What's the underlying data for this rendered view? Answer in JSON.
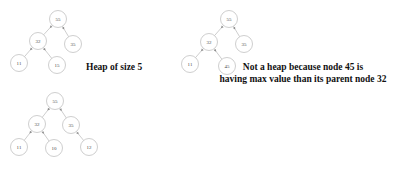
{
  "figure": {
    "background_color": "#ffffff",
    "node_fill": "#ffffff",
    "node_stroke": "#b9b9b9",
    "edge_color": "#b9b9b9",
    "text_color": "#4a4a4a",
    "caption_color": "#111111"
  },
  "trees": [
    {
      "id": "tree-heap-size-5",
      "node_count": 5,
      "nodes": [
        {
          "id": "t1-n0",
          "value": "55",
          "x": 58,
          "y": 19,
          "r": 8.5
        },
        {
          "id": "t1-n1",
          "value": "32",
          "x": 38,
          "y": 41,
          "r": 8.5
        },
        {
          "id": "t1-n2",
          "value": "35",
          "x": 73,
          "y": 44,
          "r": 8.5
        },
        {
          "id": "t1-n3",
          "value": "11",
          "x": 19,
          "y": 63,
          "r": 8.5
        },
        {
          "id": "t1-n4",
          "value": "15",
          "x": 57,
          "y": 65,
          "r": 8.5
        }
      ],
      "edges": [
        {
          "from": "t1-n0",
          "to": "t1-n1"
        },
        {
          "from": "t1-n0",
          "to": "t1-n2"
        },
        {
          "from": "t1-n1",
          "to": "t1-n3"
        },
        {
          "from": "t1-n1",
          "to": "t1-n4"
        }
      ]
    },
    {
      "id": "tree-not-a-heap",
      "node_count": 5,
      "nodes": [
        {
          "id": "t2-n0",
          "value": "55",
          "x": 229,
          "y": 19,
          "r": 8.5
        },
        {
          "id": "t2-n1",
          "value": "32",
          "x": 209,
          "y": 42,
          "r": 8.5
        },
        {
          "id": "t2-n2",
          "value": "35",
          "x": 244,
          "y": 44,
          "r": 8.5
        },
        {
          "id": "t2-n3",
          "value": "11",
          "x": 190,
          "y": 64,
          "r": 8.5
        },
        {
          "id": "t2-n4",
          "value": "45",
          "x": 227,
          "y": 66,
          "r": 8.5
        }
      ],
      "edges": [
        {
          "from": "t2-n0",
          "to": "t2-n1"
        },
        {
          "from": "t2-n0",
          "to": "t2-n2"
        },
        {
          "from": "t2-n1",
          "to": "t2-n3"
        },
        {
          "from": "t2-n1",
          "to": "t2-n4"
        }
      ]
    },
    {
      "id": "tree-heap-size-6",
      "node_count": 6,
      "nodes": [
        {
          "id": "t3-n0",
          "value": "55",
          "x": 55,
          "y": 101,
          "r": 8.5
        },
        {
          "id": "t3-n1",
          "value": "32",
          "x": 37,
          "y": 124,
          "r": 8.5
        },
        {
          "id": "t3-n2",
          "value": "35",
          "x": 71,
          "y": 125,
          "r": 8.5
        },
        {
          "id": "t3-n3",
          "value": "11",
          "x": 19,
          "y": 147,
          "r": 8.5
        },
        {
          "id": "t3-n4",
          "value": "10",
          "x": 54,
          "y": 148,
          "r": 8.5
        },
        {
          "id": "t3-n5",
          "value": "12",
          "x": 89,
          "y": 147,
          "r": 8.5
        }
      ],
      "edges": [
        {
          "from": "t3-n0",
          "to": "t3-n1"
        },
        {
          "from": "t3-n0",
          "to": "t3-n2"
        },
        {
          "from": "t3-n1",
          "to": "t3-n3"
        },
        {
          "from": "t3-n1",
          "to": "t3-n4"
        },
        {
          "from": "t3-n2",
          "to": "t3-n5"
        }
      ]
    }
  ],
  "captions": {
    "heap_of_size_5": "Heap of size 5",
    "not_a_heap_line1": "Not a heap because node 45 is",
    "not_a_heap_line2": "having max value than its parent node 32"
  }
}
